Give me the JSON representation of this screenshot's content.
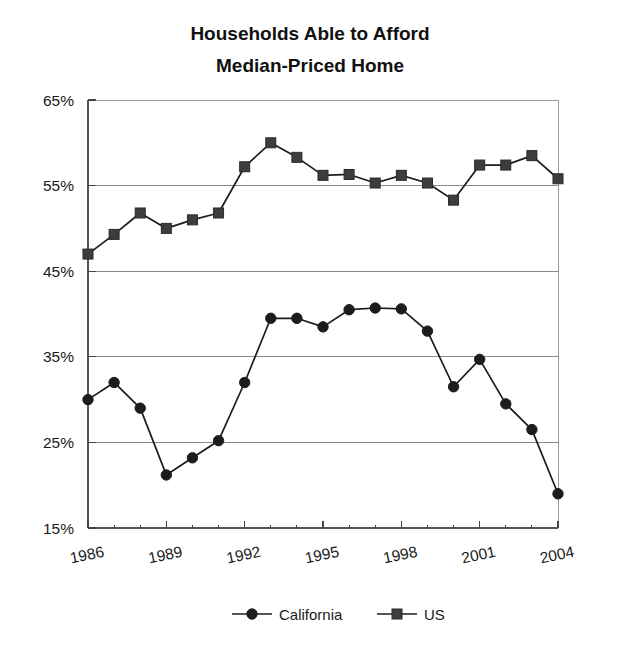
{
  "chart_data": {
    "type": "line",
    "title": "Households Able to Afford Median-Priced Home",
    "title_lines": [
      "Households Able to Afford",
      "Median-Priced Home"
    ],
    "xlabel": "",
    "ylabel": "",
    "x": [
      1986,
      1987,
      1988,
      1989,
      1990,
      1991,
      1992,
      1993,
      1994,
      1995,
      1996,
      1997,
      1998,
      1999,
      2000,
      2001,
      2002,
      2003,
      2004
    ],
    "xlim": [
      1986,
      2004
    ],
    "ylim": [
      15,
      65
    ],
    "y_ticks": [
      65,
      55,
      45,
      35,
      25,
      15
    ],
    "y_tick_labels": [
      "65%",
      "55%",
      "45%",
      "35%",
      "25%",
      "15%"
    ],
    "x_ticks": [
      1986,
      1989,
      1992,
      1995,
      1998,
      2001,
      2004
    ],
    "x_tick_labels": [
      "1986",
      "1989",
      "1992",
      "1995",
      "1998",
      "2001",
      "2004"
    ],
    "x_minor_ticks": [
      1987,
      1988,
      1990,
      1991,
      1993,
      1994,
      1996,
      1997,
      1999,
      2000,
      2002,
      2003
    ],
    "grid": true,
    "grid_axis": "y",
    "legend_position": "bottom",
    "series": [
      {
        "name": "California",
        "marker": "circle",
        "color": "#1c1c1c",
        "values": [
          30.0,
          32.0,
          29.0,
          21.2,
          23.2,
          25.2,
          32.0,
          39.5,
          39.5,
          38.5,
          40.5,
          40.7,
          40.6,
          38.0,
          31.5,
          34.7,
          29.5,
          26.5,
          19.0
        ]
      },
      {
        "name": "US",
        "marker": "square",
        "color": "#3d3d3d",
        "values": [
          47.0,
          49.3,
          51.8,
          50.0,
          51.0,
          51.8,
          57.2,
          60.0,
          58.3,
          56.2,
          56.3,
          55.3,
          56.2,
          55.3,
          53.3,
          57.4,
          57.4,
          58.5,
          55.8
        ]
      }
    ]
  },
  "legend": {
    "items": [
      {
        "label": "California",
        "marker": "circle"
      },
      {
        "label": "US",
        "marker": "square"
      }
    ]
  }
}
